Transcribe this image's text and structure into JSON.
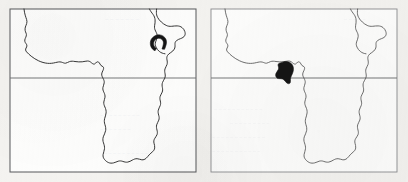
{
  "figure": {
    "kind": "two-panel-distribution-map",
    "region": "Africa",
    "background_color": "#f3f2ef",
    "paper_color": "#fdfdfc",
    "outline_color": "#2b2b2b",
    "frame_color": "#5d5f61",
    "range_fill_color": "#151515",
    "panel_count": 2
  },
  "panels": [
    {
      "id": "panel-left",
      "position": "left",
      "caption": "",
      "frame": {
        "x": 10,
        "y": 9,
        "width": 186,
        "height": 163
      },
      "gridlines": [
        {
          "name": "equator",
          "orientation": "horizontal",
          "y": 78,
          "label": ""
        }
      ],
      "range_polygon": {
        "name": "distribution-range-ethiopian-highlands",
        "shape": "hook",
        "approx_center": {
          "x": 158,
          "y": 43
        },
        "approx_width": 14,
        "approx_height": 16
      }
    },
    {
      "id": "panel-right",
      "position": "right",
      "caption": "",
      "frame": {
        "x": 7,
        "y": 9,
        "width": 186,
        "height": 163
      },
      "gridlines": [
        {
          "name": "equator",
          "orientation": "horizontal",
          "y": 78,
          "label": ""
        }
      ],
      "range_polygon": {
        "name": "distribution-range-lower-guinea-coast",
        "shape": "triangular-blob",
        "approx_center": {
          "x": 80,
          "y": 72
        },
        "approx_width": 16,
        "approx_height": 18
      }
    }
  ],
  "bleed_through_text": [
    {
      "panel": "panel-left",
      "text": "",
      "x": 104,
      "y": 22
    },
    {
      "panel": "panel-left",
      "text": "",
      "x": 104,
      "y": 118
    },
    {
      "panel": "panel-right",
      "text": "",
      "x": 40,
      "y": 120
    }
  ]
}
